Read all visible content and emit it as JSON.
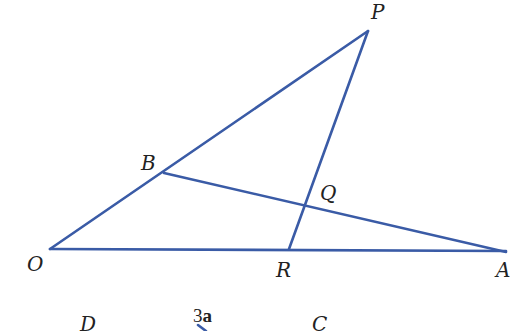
{
  "figure": {
    "line_color": "#3a5ba6",
    "line_width": 2.6,
    "points": {
      "P": {
        "label": "P",
        "x": 368,
        "y": 31
      },
      "B": {
        "label": "B",
        "x": 164,
        "y": 173
      },
      "Q": {
        "label": "Q",
        "x": 305,
        "y": 207
      },
      "O": {
        "label": "O",
        "x": 50,
        "y": 249
      },
      "R": {
        "label": "R",
        "x": 289,
        "y": 249
      },
      "A": {
        "label": "A",
        "x": 506,
        "y": 252
      }
    },
    "segments": [
      {
        "from": "O",
        "to": "P"
      },
      {
        "from": "P",
        "to": "R"
      },
      {
        "from": "B",
        "to": "A"
      },
      {
        "from": "O",
        "to": "A"
      }
    ]
  },
  "second_figure": {
    "labels": {
      "D": "D",
      "C": "C",
      "vector_coeff": "3",
      "vector_symbol": "a"
    }
  }
}
